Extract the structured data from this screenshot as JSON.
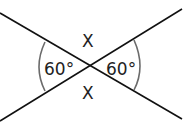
{
  "diagram": {
    "type": "intersecting-lines-angles",
    "labels": {
      "left_angle": "60°",
      "right_angle": "60°",
      "top_angle": "X",
      "bottom_angle": "X"
    },
    "colors": {
      "line": "#111111",
      "arc": "#6b6b6b",
      "text": "#222222"
    }
  }
}
